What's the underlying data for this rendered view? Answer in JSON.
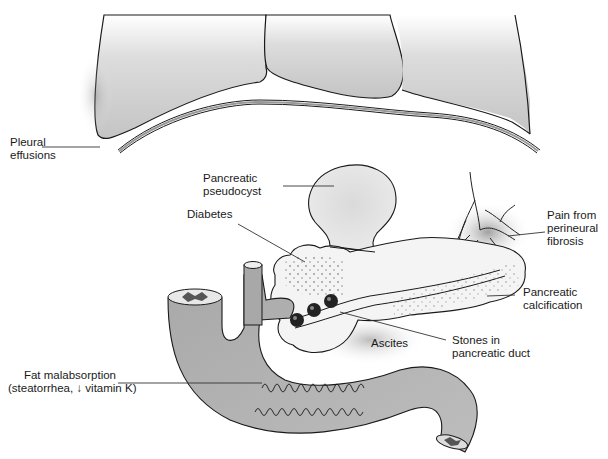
{
  "figure": {
    "type": "anatomical-diagram",
    "labels": {
      "pleural_effusions": [
        "Pleural",
        "effusions"
      ],
      "pancreatic_pseudocyst": [
        "Pancreatic",
        "pseudocyst"
      ],
      "diabetes": "Diabetes",
      "pain": [
        "Pain from",
        "perineural",
        "fibrosis"
      ],
      "calcification": [
        "Pancreatic",
        "calcification"
      ],
      "stones": [
        "Stones in",
        "pancreatic duct"
      ],
      "ascites": "Ascites",
      "fat_malabsorption": [
        "Fat malabsorption",
        "(steatorrhea, ↓ vitamin K)"
      ]
    },
    "colors": {
      "organ_fill": "#c8c8c8",
      "organ_dark": "#9a9a9a",
      "pancreas_fill": "#f2f2f2",
      "stroke": "#1a1a1a",
      "stone": "#222222",
      "leader_line": "#333333"
    }
  }
}
